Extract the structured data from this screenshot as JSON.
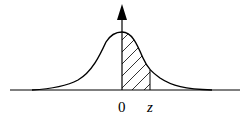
{
  "figure": {
    "type": "normal-distribution-curve",
    "labels": {
      "origin": "0",
      "z": "z"
    },
    "shading": "hatched",
    "shaded_interval": [
      "0",
      "z"
    ],
    "colors": {
      "stroke": "#000000",
      "background": "#ffffff"
    }
  }
}
